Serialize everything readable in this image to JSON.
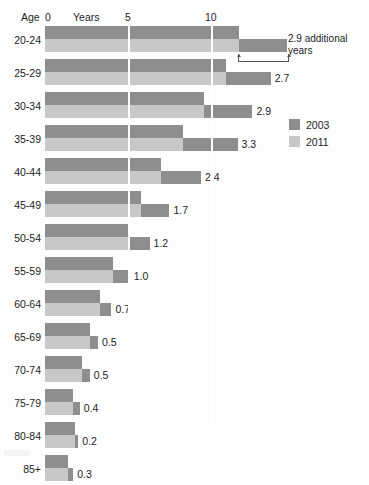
{
  "axis": {
    "age_label": "Age",
    "origin_label": "0",
    "unit_label": "Years",
    "tick_5": "5",
    "tick_10": "10"
  },
  "annotation": {
    "line1": "2.9 additional",
    "line2": "years"
  },
  "legend": [
    {
      "label": "2003",
      "color": "#8e8e8e",
      "swatch_name": "legend-swatch-2003"
    },
    {
      "label": "2011",
      "color": "#c8c8c8",
      "swatch_name": "legend-swatch-2011"
    }
  ],
  "colors": {
    "series_2003": "#8e8e8e",
    "series_2011": "#c8c8c8",
    "gridline": "#ffffff",
    "background": "#fdfdfd",
    "text": "#1d1d1d"
  },
  "chart_data": {
    "type": "bar",
    "orientation": "horizontal",
    "title": "",
    "subtitle": "",
    "xlabel": "Years",
    "ylabel": "Age",
    "xlim": [
      0,
      16
    ],
    "xticks": [
      0,
      5,
      10
    ],
    "grid": true,
    "legend_position": "right",
    "annotation": "2.9 additional years",
    "categories": [
      "20-24",
      "25-29",
      "30-34",
      "35-39",
      "40-44",
      "45-49",
      "50-54",
      "55-59",
      "60-64",
      "65-69",
      "70-74",
      "75-79",
      "80-84",
      "85+"
    ],
    "series": [
      {
        "name": "2003",
        "values": [
          11.7,
          10.9,
          9.6,
          8.3,
          7.0,
          5.8,
          5.1,
          4.1,
          3.3,
          2.7,
          2.2,
          1.7,
          1.8,
          1.4
        ]
      },
      {
        "name": "2011",
        "values": [
          14.6,
          13.6,
          12.5,
          11.6,
          9.4,
          7.5,
          6.3,
          5.1,
          4.0,
          3.2,
          2.7,
          2.1,
          2.0,
          1.7
        ]
      }
    ],
    "difference_labels": [
      "2.9 additional years",
      "2.7",
      "2.9",
      "3.3",
      "2.4",
      "1.7",
      "1.2",
      "1.0",
      "0.7",
      "0.5",
      "0.5",
      "0.4",
      "0.2",
      "0.3"
    ],
    "differences": [
      2.9,
      2.7,
      2.9,
      3.3,
      2.4,
      1.7,
      1.2,
      1.0,
      0.7,
      0.5,
      0.5,
      0.4,
      0.2,
      0.3
    ]
  },
  "rows": [
    {
      "age": "20-24",
      "v2003": 11.7,
      "v2011": 14.6,
      "diff_label": ""
    },
    {
      "age": "25-29",
      "v2003": 10.9,
      "v2011": 13.6,
      "diff_label": "2.7"
    },
    {
      "age": "30-34",
      "v2003": 9.6,
      "v2011": 12.5,
      "diff_label": "2.9"
    },
    {
      "age": "35-39",
      "v2003": 8.3,
      "v2011": 11.6,
      "diff_label": "3.3"
    },
    {
      "age": "40-44",
      "v2003": 7.0,
      "v2011": 9.4,
      "diff_label": "2.4"
    },
    {
      "age": "45-49",
      "v2003": 5.8,
      "v2011": 7.5,
      "diff_label": "1.7"
    },
    {
      "age": "50-54",
      "v2003": 5.1,
      "v2011": 6.3,
      "diff_label": "1.2"
    },
    {
      "age": "55-59",
      "v2003": 4.1,
      "v2011": 5.1,
      "diff_label": "1.0"
    },
    {
      "age": "60-64",
      "v2003": 3.3,
      "v2011": 4.0,
      "diff_label": "0.7"
    },
    {
      "age": "65-69",
      "v2003": 2.7,
      "v2011": 3.2,
      "diff_label": "0.5"
    },
    {
      "age": "70-74",
      "v2003": 2.2,
      "v2011": 2.7,
      "diff_label": "0.5"
    },
    {
      "age": "75-79",
      "v2003": 1.7,
      "v2011": 2.1,
      "diff_label": "0.4"
    },
    {
      "age": "80-84",
      "v2003": 1.8,
      "v2011": 2.0,
      "diff_label": "0.2"
    },
    {
      "age": "85+",
      "v2003": 1.4,
      "v2011": 1.7,
      "diff_label": "0.3"
    }
  ]
}
